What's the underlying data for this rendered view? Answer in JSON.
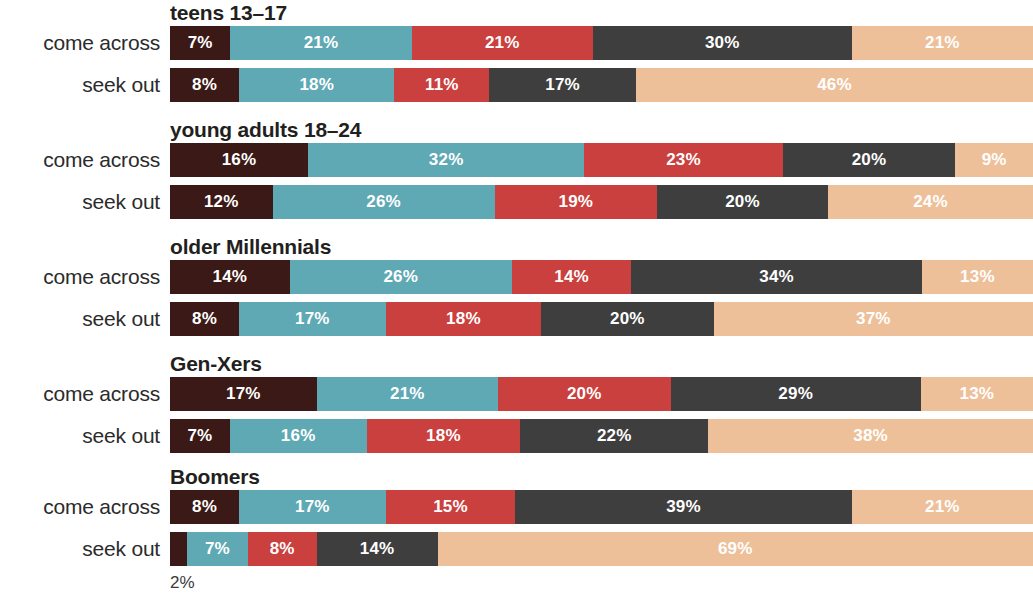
{
  "chart_data": {
    "type": "bar",
    "subtype": "stacked-horizontal-100",
    "title": "",
    "xlabel": "",
    "ylabel": "",
    "xlim": [
      0,
      100
    ],
    "grid": false,
    "legend_position": "none",
    "stack_order": [
      "maroon",
      "teal",
      "red",
      "dark-gray",
      "tan"
    ],
    "colors": {
      "maroon": "#3B1916",
      "teal": "#5FA9B4",
      "red": "#CA403E",
      "dark-gray": "#3E3E3E",
      "tan": "#EEC09A",
      "background": "#FFFFFF",
      "label_text": "#2B2B2B",
      "title_text": "#231F20",
      "value_text": "#FFFFFF",
      "note_text": "#3A3A3A"
    },
    "row_labels": [
      "come across",
      "seek out"
    ],
    "groups": [
      {
        "name": "teens 13–17",
        "rows": [
          {
            "label": "come across",
            "values": [
              7,
              21,
              21,
              30,
              21
            ],
            "labels": [
              "7%",
              "21%",
              "21%",
              "30%",
              "21%"
            ]
          },
          {
            "label": "seek out",
            "values": [
              8,
              18,
              11,
              17,
              46
            ],
            "labels": [
              "8%",
              "18%",
              "11%",
              "17%",
              "46%"
            ]
          }
        ]
      },
      {
        "name": "young adults 18–24",
        "rows": [
          {
            "label": "come across",
            "values": [
              16,
              32,
              23,
              20,
              9
            ],
            "labels": [
              "16%",
              "32%",
              "23%",
              "20%",
              "9%"
            ]
          },
          {
            "label": "seek out",
            "values": [
              12,
              26,
              19,
              20,
              24
            ],
            "labels": [
              "12%",
              "26%",
              "19%",
              "20%",
              "24%"
            ]
          }
        ]
      },
      {
        "name": "older Millennials",
        "rows": [
          {
            "label": "come across",
            "values": [
              14,
              26,
              14,
              34,
              13
            ],
            "labels": [
              "14%",
              "26%",
              "14%",
              "34%",
              "13%"
            ]
          },
          {
            "label": "seek out",
            "values": [
              8,
              17,
              18,
              20,
              37
            ],
            "labels": [
              "8%",
              "17%",
              "18%",
              "20%",
              "37%"
            ]
          }
        ]
      },
      {
        "name": "Gen-Xers",
        "rows": [
          {
            "label": "come across",
            "values": [
              17,
              21,
              20,
              29,
              13
            ],
            "labels": [
              "17%",
              "21%",
              "20%",
              "29%",
              "13%"
            ]
          },
          {
            "label": "seek out",
            "values": [
              7,
              16,
              18,
              22,
              38
            ],
            "labels": [
              "7%",
              "16%",
              "18%",
              "22%",
              "38%"
            ]
          }
        ]
      },
      {
        "name": "Boomers",
        "rows": [
          {
            "label": "come across",
            "values": [
              8,
              17,
              15,
              39,
              21
            ],
            "labels": [
              "8%",
              "17%",
              "15%",
              "39%",
              "21%"
            ]
          },
          {
            "label": "seek out",
            "values": [
              2,
              7,
              8,
              14,
              69
            ],
            "labels": [
              "2%",
              "7%",
              "8%",
              "14%",
              "69%"
            ],
            "outside_label": {
              "text": "2%",
              "segment_index": 0
            }
          }
        ]
      }
    ]
  }
}
